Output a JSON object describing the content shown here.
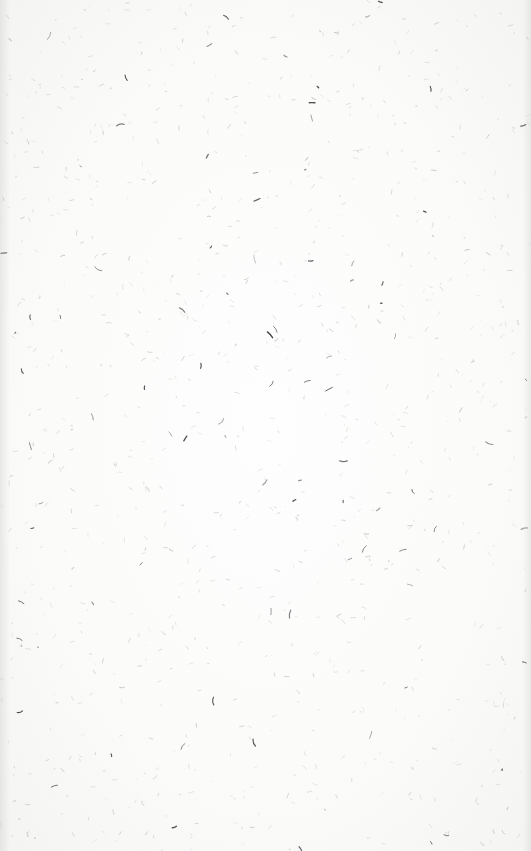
{
  "scene": {
    "description": "Blank off-white paper texture with scattered dark fiber specks",
    "paper_color": "#fbfbfa",
    "speck_color": "#3a3a3a",
    "faint_speck_color": "#b5b5b3",
    "dark_speck_count": 90,
    "faint_speck_count": 900
  }
}
